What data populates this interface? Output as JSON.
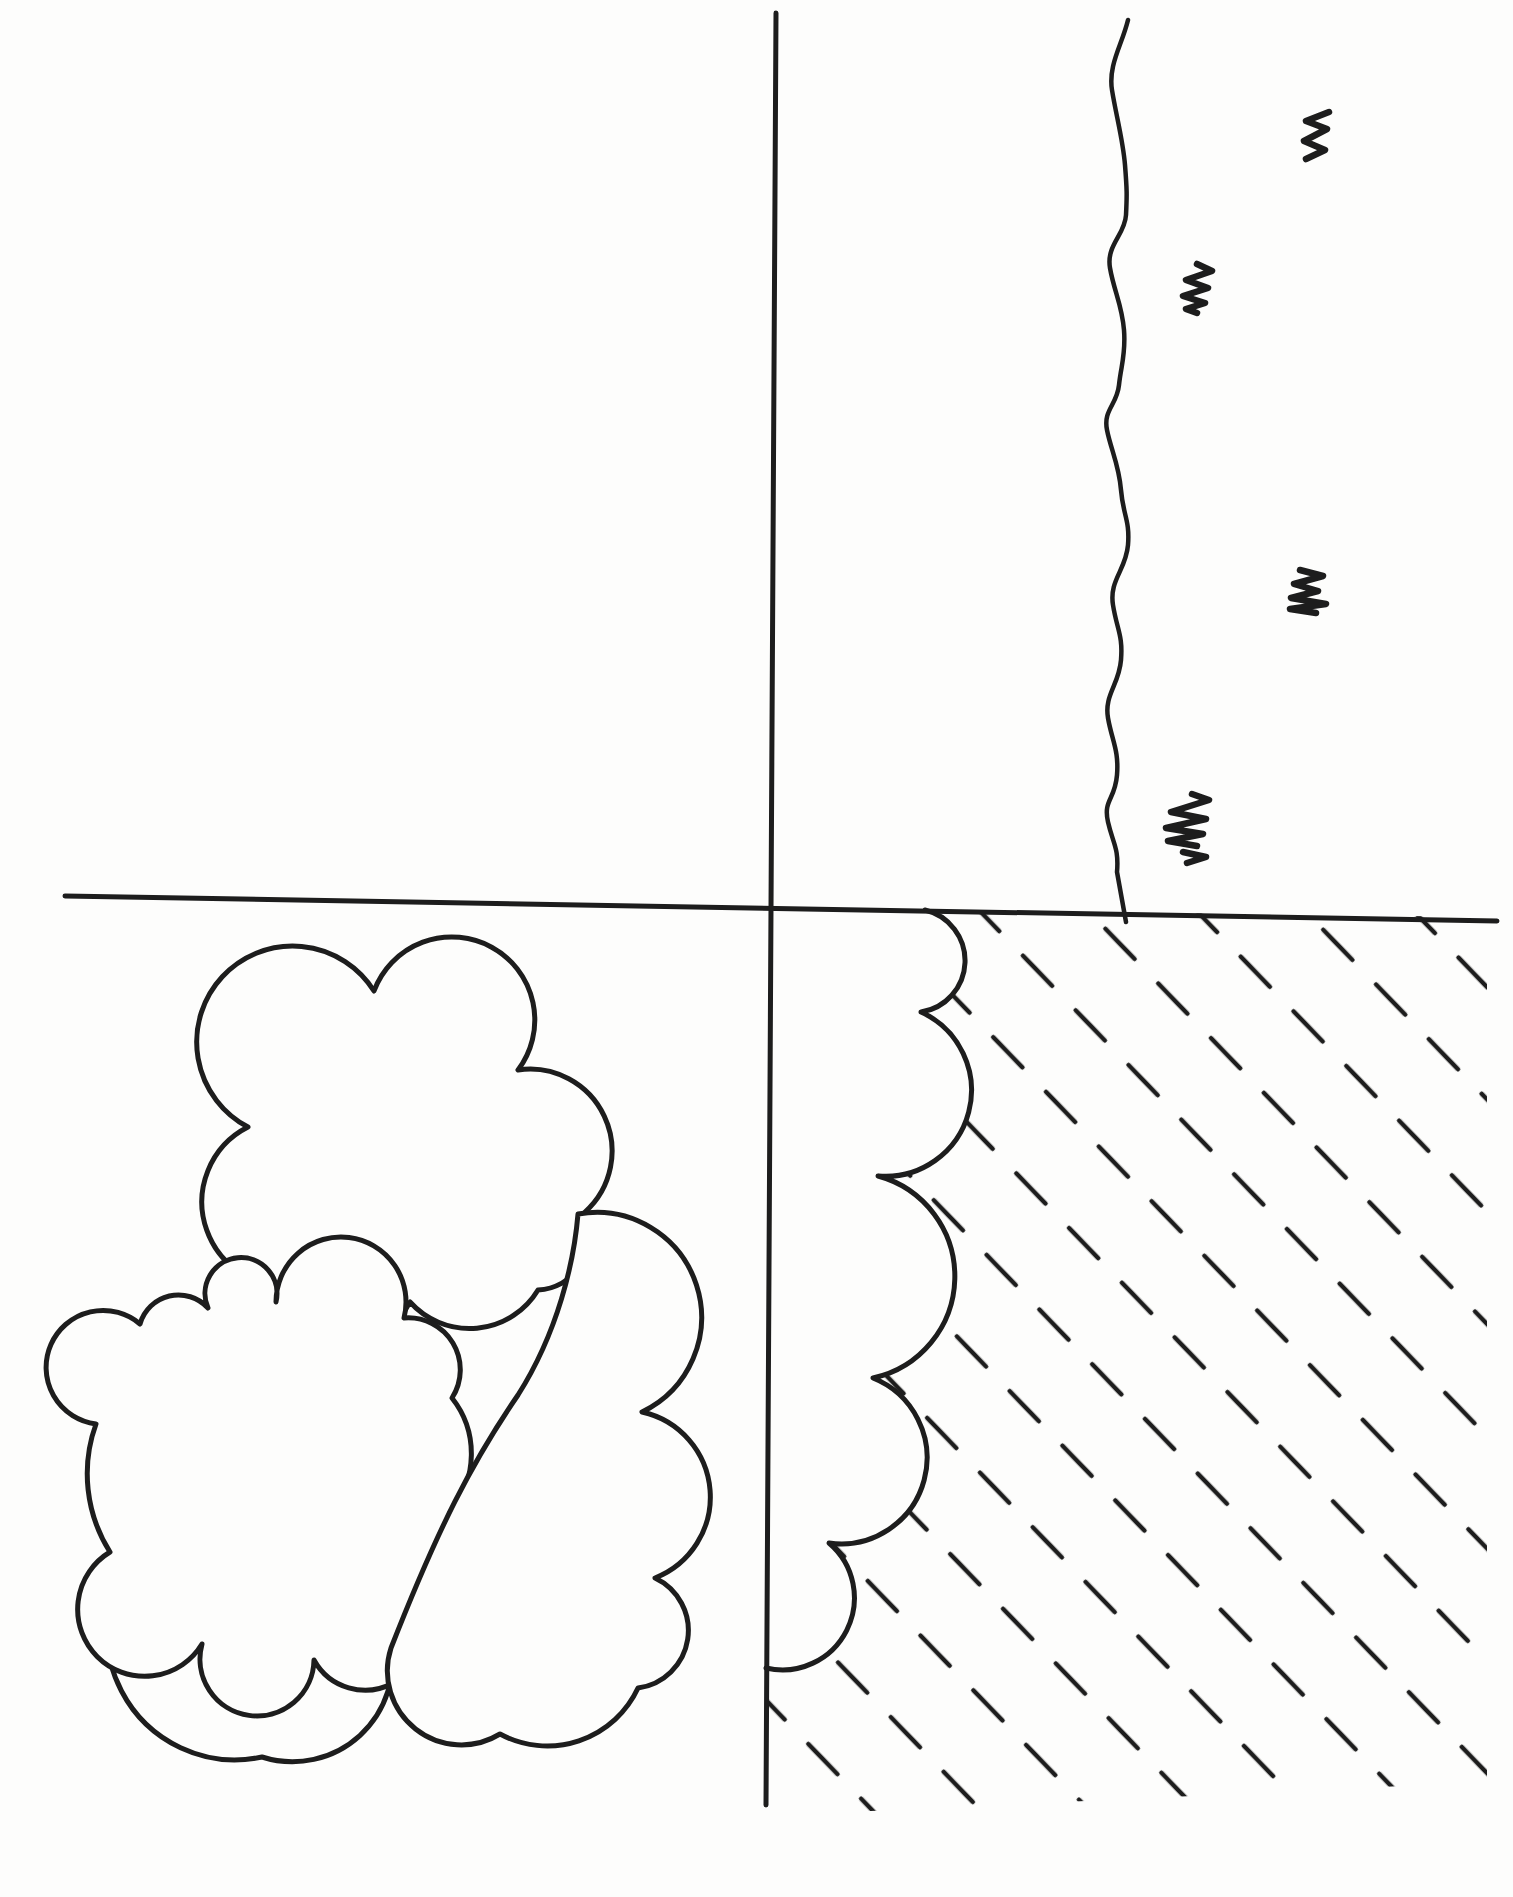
{
  "canvas": {
    "width": 1513,
    "height": 1897,
    "background_color": "#fdfdfc",
    "ink_color": "#1d1d1d"
  },
  "scene": {
    "description": "Hand-drawn ink field sketch divided into four quadrants by one vertical and one horizontal line",
    "quadrants": {
      "top_left": {
        "label": "empty quadrant"
      },
      "top_right": {
        "label": "wavy stream line with four grass-tuft scribbles",
        "tuft_count": 4
      },
      "bottom_left": {
        "label": "cluster of overlapping scallop-edged cloud/shrub blobs",
        "blob_count": 4
      },
      "bottom_right": {
        "label": "diagonal dashed hatching bounded by a scalloped edge",
        "hatch_angle_degrees": 46
      }
    },
    "elements": [
      {
        "name": "vertical-divider-line",
        "kind": "line"
      },
      {
        "name": "horizontal-divider-line",
        "kind": "line"
      },
      {
        "name": "stream-line",
        "kind": "wavy line"
      },
      {
        "name": "grass-tuft",
        "kind": "scribble",
        "count": 4
      },
      {
        "name": "cloud-blob",
        "kind": "scalloped blob",
        "count": 4
      },
      {
        "name": "hatched-area",
        "kind": "dashed diagonal fill"
      },
      {
        "name": "scalloped-border",
        "kind": "arc chain",
        "cusp_count": 4
      }
    ]
  }
}
